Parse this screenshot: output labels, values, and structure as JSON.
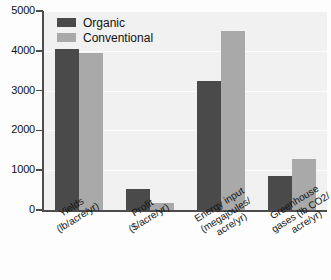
{
  "chart_data": {
    "type": "bar",
    "title": "",
    "subtitle": "",
    "xlabel": "",
    "ylabel": "",
    "ylim": [
      0,
      5000
    ],
    "grid": true,
    "legend_position": "top-left",
    "categories": [
      "Yields (lb/acre/yr)",
      "Profit ($/acre/yr)",
      "Energy input (megajoules/acre/yr)",
      "Greenhouse gases (lb CO2/acre/yr)"
    ],
    "category_lines": [
      [
        "Yields",
        "(lb/acre/yr)"
      ],
      [
        "Profit",
        "($/acre/yr)"
      ],
      [
        "Energy input",
        "(megajoules/",
        "acre/yr)"
      ],
      [
        "Greenhouse",
        "gases (lb CO2/",
        "acre/yr)"
      ]
    ],
    "series": [
      {
        "name": "Organic",
        "color": "#4a4a4a",
        "values": [
          4050,
          530,
          3250,
          850
        ]
      },
      {
        "name": "Conventional",
        "color": "#a9a9a9",
        "values": [
          3950,
          170,
          4500,
          1280
        ]
      }
    ],
    "y_ticks": [
      0,
      1000,
      2000,
      3000,
      4000,
      5000
    ],
    "y_tick_labels": [
      "0",
      "1000",
      "2000",
      "3000",
      "4000",
      "5000"
    ]
  },
  "axes": {
    "axis_color": "#4c4c4c",
    "plot_background": "#f1f1f1",
    "gridline_color": "#ffffff"
  }
}
